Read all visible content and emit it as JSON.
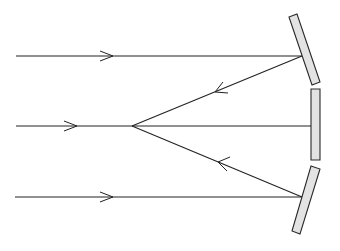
{
  "diagram": {
    "colors": {
      "line": "#222222",
      "mirror_fill": "#e3e3e3",
      "mirror_stroke": "#2a2a2a",
      "background": "#ffffff"
    },
    "incident_rays": [
      {
        "id": "top",
        "x1": 16,
        "y1": 56,
        "x2": 302,
        "y2": 56,
        "arrow_tip": [
          113,
          56
        ]
      },
      {
        "id": "middle",
        "x1": 16,
        "y1": 126,
        "x2": 311,
        "y2": 126,
        "arrow_tip": [
          77,
          126
        ]
      },
      {
        "id": "bottom",
        "x1": 15,
        "y1": 197,
        "x2": 302,
        "y2": 197,
        "arrow_tip": [
          113,
          197
        ]
      }
    ],
    "reflected_rays": [
      {
        "id": "upper",
        "x1": 302,
        "y1": 56,
        "x2": 132,
        "y2": 126,
        "arrow_tip": [
          215,
          92
        ]
      },
      {
        "id": "lower",
        "x1": 302,
        "y1": 197,
        "x2": 132,
        "y2": 126,
        "arrow_tip": [
          218,
          162
        ]
      }
    ],
    "focal_point": [
      132,
      126
    ],
    "mirrors": [
      {
        "id": "top",
        "points": "289,17 297,14 320,82 312,85"
      },
      {
        "id": "middle",
        "points": "311,89 320,89 320,160 311,160"
      },
      {
        "id": "bottom",
        "points": "311,166 320,169 300,234 292,231"
      }
    ]
  }
}
